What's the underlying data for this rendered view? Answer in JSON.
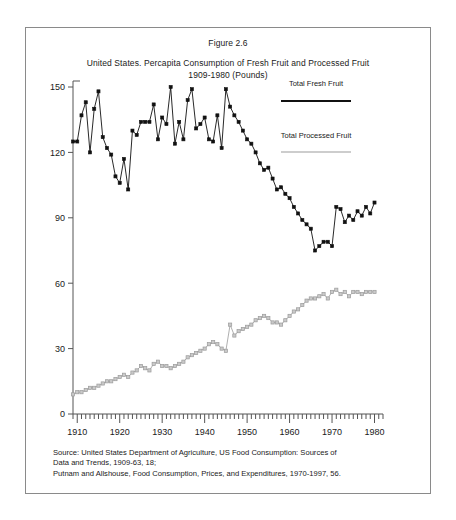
{
  "figure": {
    "number": "Figure 2.6",
    "title_line1": "United States. Percapita Consumption of Fresh Fruit and Processed Fruit",
    "title_line2": "1909-1980 (Pounds)"
  },
  "source": {
    "line1": "Source: United States Department of Agriculture, US Food Consumption: Sources of",
    "line2": "Data and Trends, 1909-63, 18;",
    "line3": "Putnam and Allshouse, Food Consumption, Prices, and Expenditures, 1970-1997, 56."
  },
  "legend": {
    "fresh_label": "Total Fresh Fruit",
    "processed_label": "Total Processed Fruit"
  },
  "colors": {
    "fresh": "#111111",
    "processed": "#9b9b9b",
    "axis": "#555555",
    "border": "#8a8a8a",
    "text": "#1a1a1a"
  },
  "chart_data": {
    "type": "line",
    "title": "United States. Percapita Consumption of Fresh Fruit and Processed Fruit 1909-1980 (Pounds)",
    "xlabel": "",
    "ylabel": "",
    "xlim": [
      1909,
      1982
    ],
    "ylim": [
      0,
      150
    ],
    "yticks": [
      0,
      30,
      60,
      90,
      120,
      150
    ],
    "xticks": [
      1910,
      1920,
      1930,
      1940,
      1950,
      1960,
      1970,
      1980
    ],
    "xtick_labels": [
      "1910",
      "1920",
      "1930",
      "1940",
      "1950",
      "1960",
      "1970",
      "1980"
    ],
    "ytick_labels": [
      "0",
      "30",
      "60",
      "90",
      "120",
      "150"
    ],
    "minor_xtick_step": 1,
    "grid": false,
    "legend_position": "right",
    "markers": "square",
    "x": [
      1909,
      1910,
      1911,
      1912,
      1913,
      1914,
      1915,
      1916,
      1917,
      1918,
      1919,
      1920,
      1921,
      1922,
      1923,
      1924,
      1925,
      1926,
      1927,
      1928,
      1929,
      1930,
      1931,
      1932,
      1933,
      1934,
      1935,
      1936,
      1937,
      1938,
      1939,
      1940,
      1941,
      1942,
      1943,
      1944,
      1945,
      1946,
      1947,
      1948,
      1949,
      1950,
      1951,
      1952,
      1953,
      1954,
      1955,
      1956,
      1957,
      1958,
      1959,
      1960,
      1961,
      1962,
      1963,
      1964,
      1965,
      1966,
      1967,
      1968,
      1969,
      1970,
      1971,
      1972,
      1973,
      1974,
      1975,
      1976,
      1977,
      1978,
      1979,
      1980
    ],
    "series": [
      {
        "name": "Total Fresh Fruit",
        "color": "#111111",
        "values": [
          125,
          125,
          137,
          143,
          120,
          140,
          148,
          127,
          122,
          119,
          109,
          106,
          117,
          103,
          130,
          128,
          134,
          134,
          134,
          142,
          126,
          136,
          133,
          150,
          124,
          134,
          126,
          144,
          149,
          131,
          133,
          136,
          126,
          125,
          137,
          122,
          149,
          141,
          137,
          134,
          130,
          126,
          124,
          120,
          115,
          112,
          113,
          108,
          103,
          104,
          101,
          99,
          95,
          92,
          89,
          87,
          85,
          75,
          77,
          79,
          79,
          77,
          95,
          94,
          88,
          91,
          89,
          93,
          91,
          95,
          92,
          97
        ]
      },
      {
        "name": "Total Processed Fruit",
        "color": "#9b9b9b",
        "values": [
          9,
          10,
          10,
          11,
          12,
          12,
          13,
          14,
          15,
          15,
          16,
          17,
          18,
          17,
          19,
          20,
          22,
          21,
          20,
          23,
          24,
          22,
          22,
          21,
          22,
          23,
          24,
          26,
          27,
          28,
          29,
          30,
          32,
          33,
          32,
          30,
          29,
          41,
          36,
          38,
          39,
          40,
          41,
          43,
          44,
          45,
          44,
          42,
          42,
          41,
          43,
          45,
          47,
          48,
          50,
          52,
          53,
          53,
          54,
          55,
          53,
          56,
          57,
          55,
          56,
          54,
          56,
          56,
          55,
          56,
          56,
          56
        ]
      }
    ]
  }
}
